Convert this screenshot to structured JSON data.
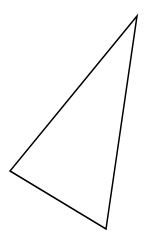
{
  "diagram": {
    "background": "#ffffff",
    "shapes": [
      {
        "type": "triangle",
        "stroke": "#000000",
        "stroke_width": 1.5,
        "fill": "none",
        "vertices": [
          {
            "name": "top-right",
            "x": 137,
            "y": 16
          },
          {
            "name": "left",
            "x": 10,
            "y": 171
          },
          {
            "name": "bottom",
            "x": 106,
            "y": 229
          }
        ]
      }
    ]
  }
}
